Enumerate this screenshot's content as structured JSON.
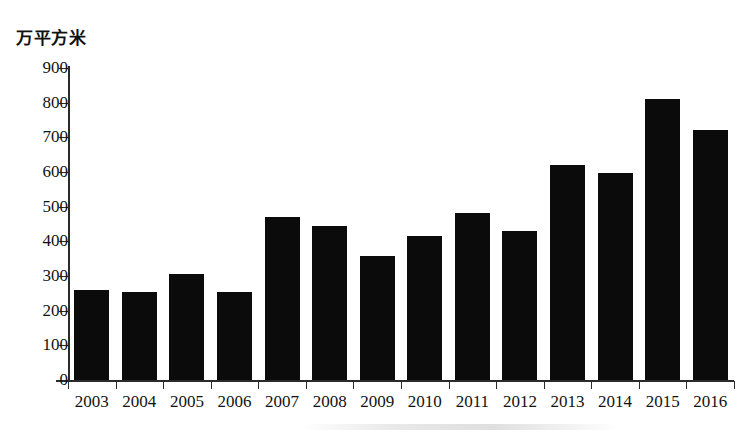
{
  "chart_data": {
    "type": "bar",
    "title": "",
    "subtitle": "",
    "xlabel": "",
    "ylabel": "万平方米",
    "ylim": [
      0,
      900
    ],
    "ytick_step": 100,
    "yticks": [
      900,
      800,
      700,
      600,
      500,
      400,
      300,
      200,
      100,
      0
    ],
    "grid": false,
    "legend": null,
    "bar_color": "#0b0b0b",
    "categories": [
      "2003",
      "2004",
      "2005",
      "2006",
      "2007",
      "2008",
      "2009",
      "2010",
      "2011",
      "2012",
      "2013",
      "2014",
      "2015",
      "2016"
    ],
    "values": [
      260,
      255,
      307,
      253,
      470,
      443,
      357,
      415,
      482,
      430,
      620,
      598,
      810,
      722
    ],
    "series": [
      {
        "name": "",
        "values": [
          260,
          255,
          307,
          253,
          470,
          443,
          357,
          415,
          482,
          430,
          620,
          598,
          810,
          722
        ]
      }
    ]
  },
  "axis": {
    "unit_caption": "万平方米"
  }
}
